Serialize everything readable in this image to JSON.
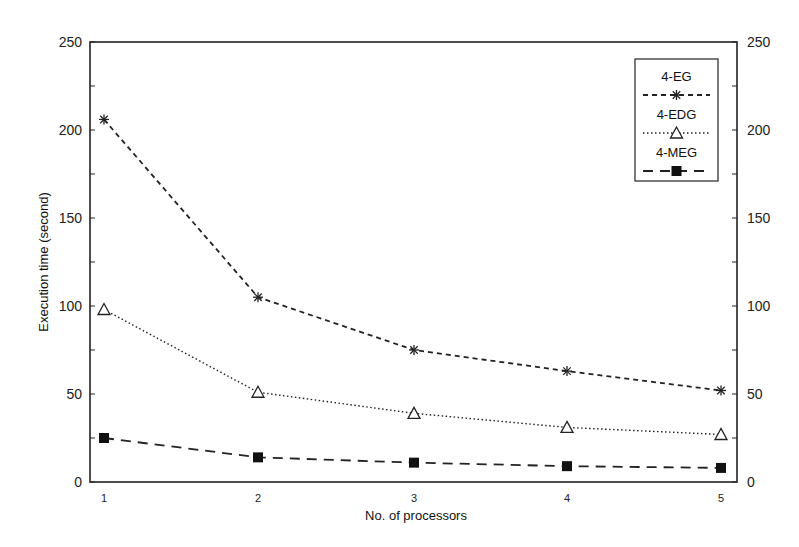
{
  "chart_data": {
    "type": "line",
    "title": "",
    "xlabel": "No. of processors",
    "ylabel": "Execution time (second)",
    "x": [
      1,
      2,
      3,
      4,
      5
    ],
    "xticks": [
      "1",
      "2",
      "3",
      "4",
      "5"
    ],
    "yticks": [
      "0",
      "50",
      "100",
      "150",
      "200",
      "250"
    ],
    "yticks_right": [
      "0",
      "50",
      "100",
      "150",
      "200",
      "250"
    ],
    "ylim": [
      0,
      250
    ],
    "xlim": [
      1,
      5
    ],
    "grid": false,
    "legend_position": "upper right",
    "series": [
      {
        "name": "4-EG",
        "marker": "asterisk",
        "line": "dashed",
        "values": [
          206,
          105,
          75,
          63,
          52
        ]
      },
      {
        "name": "4-EDG",
        "marker": "open-triangle",
        "line": "dotted",
        "values": [
          98,
          51,
          39,
          31,
          27
        ]
      },
      {
        "name": "4-MEG",
        "marker": "filled-square",
        "line": "long-dashed",
        "values": [
          25,
          14,
          11,
          9,
          8
        ]
      }
    ]
  },
  "legend": {
    "items": [
      "4-EG",
      "4-EDG",
      "4-MEG"
    ]
  }
}
